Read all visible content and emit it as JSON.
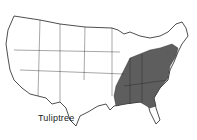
{
  "map": {
    "title": "Tuliptree",
    "region": "Contiguous United States",
    "range_description": "Eastern United States (shaded)",
    "colors": {
      "range_fill": "#5e5e5e",
      "land_fill": "#ffffff",
      "outline": "#222222"
    }
  }
}
